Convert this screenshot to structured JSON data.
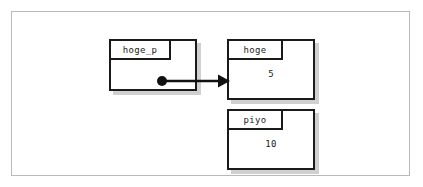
{
  "diagram": {
    "background_color": "#ffffff",
    "frame_color": "#b9b9b9",
    "stroke_color": "#1a1a1a",
    "shadow_color": "#969696",
    "nodes": [
      {
        "id": "hoge_p",
        "label": "hoge_p",
        "value": "",
        "role": "pointer"
      },
      {
        "id": "hoge",
        "label": "hoge",
        "value": "5",
        "role": "object"
      },
      {
        "id": "piyo",
        "label": "piyo",
        "value": "10",
        "role": "object"
      }
    ],
    "edges": [
      {
        "id": "hoge_p-to-hoge",
        "from": "hoge_p",
        "to": "hoge",
        "start_marker": "filled-dot",
        "end_marker": "filled-arrowhead"
      }
    ]
  }
}
